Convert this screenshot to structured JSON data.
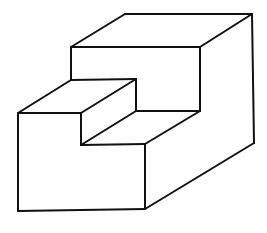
{
  "diagram": {
    "type": "isometric-line-drawing",
    "stroke_color": "#111111",
    "background": "#ffffff",
    "edges": [
      {
        "name": "upper-top-back",
        "points": [
          [
            125,
            14
          ],
          [
            252,
            14
          ]
        ]
      },
      {
        "name": "upper-top-left",
        "points": [
          [
            125,
            14
          ],
          [
            71,
            47
          ]
        ]
      },
      {
        "name": "upper-top-front",
        "points": [
          [
            71,
            47
          ],
          [
            200,
            47
          ]
        ]
      },
      {
        "name": "upper-top-right",
        "points": [
          [
            200,
            47
          ],
          [
            252,
            14
          ]
        ]
      },
      {
        "name": "right-back-vertical",
        "points": [
          [
            252,
            14
          ],
          [
            254,
            143
          ]
        ]
      },
      {
        "name": "upper-front-left-vertical",
        "points": [
          [
            71,
            47
          ],
          [
            71,
            80
          ]
        ]
      },
      {
        "name": "upper-front-right-vertical",
        "points": [
          [
            200,
            47
          ],
          [
            200,
            111
          ]
        ]
      },
      {
        "name": "step-top-back",
        "points": [
          [
            71,
            80
          ],
          [
            136,
            79
          ]
        ]
      },
      {
        "name": "step-top-left",
        "points": [
          [
            71,
            80
          ],
          [
            18,
            113
          ]
        ]
      },
      {
        "name": "step-top-front",
        "points": [
          [
            18,
            113
          ],
          [
            81,
            113
          ]
        ]
      },
      {
        "name": "step-top-right",
        "points": [
          [
            81,
            113
          ],
          [
            136,
            79
          ]
        ]
      },
      {
        "name": "step-riser-back-vertical",
        "points": [
          [
            136,
            79
          ],
          [
            136,
            111
          ]
        ]
      },
      {
        "name": "inner-back-bottom",
        "points": [
          [
            136,
            111
          ],
          [
            200,
            111
          ]
        ]
      },
      {
        "name": "step-riser-front-vertical",
        "points": [
          [
            81,
            113
          ],
          [
            81,
            145
          ]
        ]
      },
      {
        "name": "step-riser-diagonal",
        "points": [
          [
            81,
            145
          ],
          [
            136,
            111
          ]
        ]
      },
      {
        "name": "lower-top-front",
        "points": [
          [
            81,
            145
          ],
          [
            145,
            144
          ]
        ]
      },
      {
        "name": "lower-top-right",
        "points": [
          [
            145,
            144
          ],
          [
            200,
            111
          ]
        ]
      },
      {
        "name": "front-left-vertical",
        "points": [
          [
            18,
            113
          ],
          [
            18,
            211
          ]
        ]
      },
      {
        "name": "front-bottom",
        "points": [
          [
            18,
            211
          ],
          [
            145,
            209
          ]
        ]
      },
      {
        "name": "front-right-vertical",
        "points": [
          [
            145,
            144
          ],
          [
            145,
            209
          ]
        ]
      },
      {
        "name": "bottom-right",
        "points": [
          [
            145,
            209
          ],
          [
            254,
            143
          ]
        ]
      }
    ]
  }
}
